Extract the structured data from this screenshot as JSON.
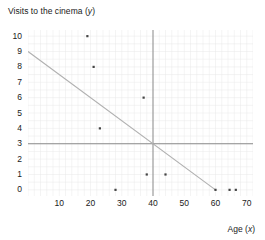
{
  "chart_data": {
    "type": "scatter",
    "title": "Visits to the cinema (y)",
    "title_main": "Visits to the cinema (",
    "title_var": "y",
    "title_close": ")",
    "xlabel": "Age (x)",
    "xlabel_main": "Age (",
    "xlabel_var": "x",
    "xlabel_close": ")",
    "ylabel": "Visits to the cinema (y)",
    "xlim": [
      0,
      72
    ],
    "ylim": [
      -0.4,
      10.4
    ],
    "xticks": [
      10,
      20,
      30,
      40,
      50,
      60,
      70
    ],
    "yticks": [
      0,
      1,
      2,
      3,
      4,
      5,
      6,
      7,
      8,
      9,
      10
    ],
    "grid": true,
    "grid_color": "#e8e8e8",
    "legend": "none",
    "point_color": "#444444",
    "line_color": "#b0b0b0",
    "axis_color": "#8c8c8c",
    "points": [
      {
        "x": 19,
        "y": 10
      },
      {
        "x": 21,
        "y": 8
      },
      {
        "x": 37,
        "y": 6
      },
      {
        "x": 23,
        "y": 4
      },
      {
        "x": 38,
        "y": 1
      },
      {
        "x": 44,
        "y": 1
      },
      {
        "x": 28,
        "y": 0
      },
      {
        "x": 60,
        "y": 0
      },
      {
        "x": 64.5,
        "y": 0
      },
      {
        "x": 66.5,
        "y": 0
      }
    ],
    "trend_line": {
      "x1": 0,
      "y1": 9,
      "x2": 60,
      "y2": 0
    },
    "crosshair_vertical_x": 40,
    "crosshair_horizontal_y": 3
  }
}
